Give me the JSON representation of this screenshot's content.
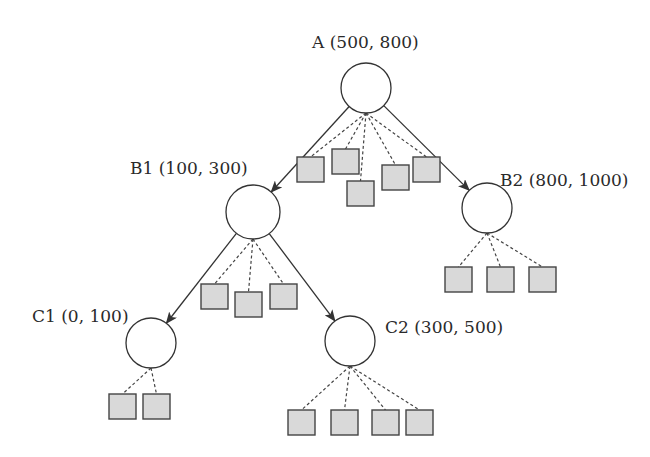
{
  "diagram": {
    "type": "tree",
    "nodes": [
      {
        "id": "A",
        "label": "A (500, 800)",
        "cx": 366,
        "cy": 88,
        "r": 25,
        "lx": 312,
        "ly": 48,
        "leaves": [
          [
            297,
            157
          ],
          [
            332,
            149
          ],
          [
            347,
            181
          ],
          [
            382,
            165
          ],
          [
            413,
            157
          ]
        ]
      },
      {
        "id": "B1",
        "label": "B1 (100, 300)",
        "cx": 253,
        "cy": 212,
        "r": 27,
        "lx": 130,
        "ly": 174,
        "leaves": [
          [
            201,
            284
          ],
          [
            235,
            292
          ],
          [
            270,
            284
          ]
        ]
      },
      {
        "id": "B2",
        "label": "B2 (800, 1000)",
        "cx": 487,
        "cy": 208,
        "r": 25,
        "lx": 500,
        "ly": 186,
        "leaves": [
          [
            445,
            267
          ],
          [
            487,
            267
          ],
          [
            529,
            267
          ]
        ]
      },
      {
        "id": "C1",
        "label": "C1 (0, 100)",
        "cx": 151,
        "cy": 343,
        "r": 25,
        "lx": 32,
        "ly": 322,
        "leaves": [
          [
            109,
            394
          ],
          [
            143,
            394
          ]
        ]
      },
      {
        "id": "C2",
        "label": "C2 (300, 500)",
        "cx": 350,
        "cy": 341,
        "r": 25,
        "lx": 385,
        "ly": 333,
        "leaves": [
          [
            288,
            410
          ],
          [
            331,
            410
          ],
          [
            372,
            410
          ],
          [
            406,
            410
          ]
        ]
      }
    ],
    "edges": [
      [
        "A",
        "B1"
      ],
      [
        "A",
        "B2"
      ],
      [
        "B1",
        "C1"
      ],
      [
        "B1",
        "C2"
      ]
    ],
    "leaf_size": 27
  }
}
